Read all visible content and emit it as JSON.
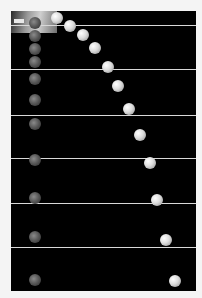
{
  "image": {
    "description": "Stroboscopic photograph of two balls released simultaneously: one dropped vertically, one projected horizontally",
    "background_color": "#000000",
    "frame_color": "#f4f4f4",
    "line_color": "#d8d8d8"
  },
  "reference_lines_y": [
    14,
    58,
    104,
    147,
    192,
    236
  ],
  "dropped_balls": [
    {
      "x": 24,
      "y": 12,
      "r": 6
    },
    {
      "x": 24,
      "y": 25,
      "r": 6
    },
    {
      "x": 24,
      "y": 38,
      "r": 6
    },
    {
      "x": 24,
      "y": 51,
      "r": 6
    },
    {
      "x": 24,
      "y": 68,
      "r": 6
    },
    {
      "x": 24,
      "y": 89,
      "r": 6
    },
    {
      "x": 24,
      "y": 113,
      "r": 6
    },
    {
      "x": 24,
      "y": 149,
      "r": 6
    },
    {
      "x": 24,
      "y": 187,
      "r": 6
    },
    {
      "x": 24,
      "y": 226,
      "r": 6
    },
    {
      "x": 24,
      "y": 269,
      "r": 6
    }
  ],
  "projected_balls": [
    {
      "x": 46,
      "y": 7,
      "r": 6
    },
    {
      "x": 59,
      "y": 15,
      "r": 6
    },
    {
      "x": 72,
      "y": 24,
      "r": 6
    },
    {
      "x": 84,
      "y": 37,
      "r": 6
    },
    {
      "x": 97,
      "y": 56,
      "r": 6
    },
    {
      "x": 107,
      "y": 75,
      "r": 6
    },
    {
      "x": 118,
      "y": 98,
      "r": 6
    },
    {
      "x": 129,
      "y": 124,
      "r": 6
    },
    {
      "x": 139,
      "y": 152,
      "r": 6
    },
    {
      "x": 146,
      "y": 189,
      "r": 6
    },
    {
      "x": 155,
      "y": 229,
      "r": 6
    },
    {
      "x": 164,
      "y": 270,
      "r": 6
    }
  ]
}
